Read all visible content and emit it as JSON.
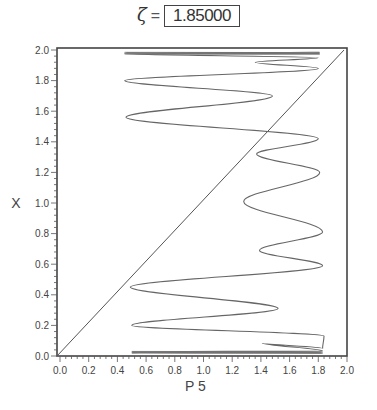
{
  "title": {
    "symbol": "ζ",
    "equals": "=",
    "value": "1.85000"
  },
  "chart_data": {
    "type": "line",
    "xlabel": "P 5",
    "ylabel": "X",
    "xlim": [
      0.0,
      2.0
    ],
    "ylim": [
      0.0,
      2.0
    ],
    "grid": false,
    "legend": null,
    "x_ticks": [
      "0.0",
      "0.2",
      "0.4",
      "0.6",
      "0.8",
      "1.0",
      "1.2",
      "1.4",
      "1.6",
      "1.8",
      "2.0"
    ],
    "y_ticks": [
      "0.0",
      "0.2",
      "0.4",
      "0.6",
      "0.8",
      "1.0",
      "1.2",
      "1.4",
      "1.6",
      "1.8",
      "2.0"
    ],
    "series": [
      {
        "name": "identity line P5 = X",
        "points": [
          [
            0.0,
            0.0
          ],
          [
            2.0,
            2.0
          ]
        ]
      },
      {
        "name": "P5(X) oscillating curve",
        "points": [
          [
            1.82,
            0.02
          ],
          [
            0.5,
            0.022
          ],
          [
            1.82,
            0.025
          ],
          [
            0.5,
            0.028
          ],
          [
            1.83,
            0.032
          ],
          [
            1.41,
            0.085
          ],
          [
            1.83,
            0.05
          ],
          [
            1.84,
            0.13
          ],
          [
            0.5,
            0.2
          ],
          [
            1.52,
            0.31
          ],
          [
            0.49,
            0.45
          ],
          [
            1.83,
            0.59
          ],
          [
            1.39,
            0.69
          ],
          [
            1.83,
            0.81
          ],
          [
            1.28,
            1.01
          ],
          [
            1.81,
            1.2
          ],
          [
            1.37,
            1.32
          ],
          [
            1.8,
            1.42
          ],
          [
            0.46,
            1.56
          ],
          [
            1.48,
            1.7
          ],
          [
            0.45,
            1.8
          ],
          [
            1.8,
            1.88
          ],
          [
            1.36,
            1.92
          ],
          [
            1.8,
            1.95
          ],
          [
            0.45,
            1.975
          ],
          [
            1.81,
            1.978
          ],
          [
            0.46,
            1.982
          ],
          [
            1.81,
            1.985
          ]
        ]
      }
    ]
  }
}
